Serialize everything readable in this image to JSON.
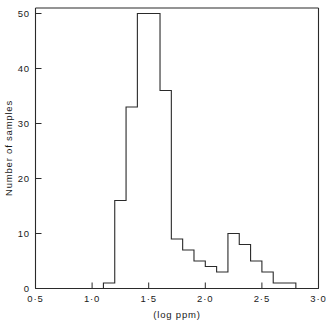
{
  "chart_data": {
    "type": "bar",
    "title": "",
    "subtitle": "",
    "xlabel": "(log ppm)",
    "ylabel": "Number of samples",
    "xlim": [
      0.5,
      3.0
    ],
    "ylim": [
      0,
      50
    ],
    "bin_width": 0.1,
    "grid": false,
    "legend": null,
    "annotations": [],
    "x_tick_labels": [
      "0·5",
      "1·0",
      "1·5",
      "2·0",
      "2·5",
      "3·0"
    ],
    "x_tick_values": [
      0.5,
      1.0,
      1.5,
      2.0,
      2.5,
      3.0
    ],
    "y_tick_labels": [
      "0",
      "10",
      "20",
      "30",
      "40",
      "50"
    ],
    "y_tick_values": [
      0,
      10,
      20,
      30,
      40,
      50
    ],
    "bin_edges": [
      0.5,
      0.6,
      0.7,
      0.8,
      0.9,
      1.0,
      1.1,
      1.2,
      1.3,
      1.4,
      1.5,
      1.6,
      1.7,
      1.8,
      1.9,
      2.0,
      2.1,
      2.2,
      2.3,
      2.4,
      2.5,
      2.6,
      2.7,
      2.8,
      2.9,
      3.0
    ],
    "categories": [
      "0.5-0.6",
      "0.6-0.7",
      "0.7-0.8",
      "0.8-0.9",
      "0.9-1.0",
      "1.0-1.1",
      "1.1-1.2",
      "1.2-1.3",
      "1.3-1.4",
      "1.4-1.5",
      "1.5-1.6",
      "1.6-1.7",
      "1.7-1.8",
      "1.8-1.9",
      "1.9-2.0",
      "2.0-2.1",
      "2.1-2.2",
      "2.2-2.3",
      "2.3-2.4",
      "2.4-2.5",
      "2.5-2.6",
      "2.6-2.7",
      "2.7-2.8",
      "2.8-2.9",
      "2.9-3.0"
    ],
    "values": [
      0,
      0,
      0,
      0,
      0,
      0,
      1,
      16,
      33,
      50,
      50,
      36,
      9,
      7,
      5,
      4,
      3,
      10,
      8,
      5,
      3,
      1,
      1,
      0,
      0
    ]
  },
  "axes": {
    "x_title": "(log ppm)",
    "y_title": "Number of samples"
  }
}
